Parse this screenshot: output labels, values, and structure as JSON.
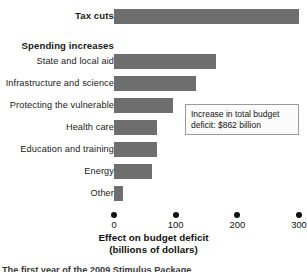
{
  "chart_data": {
    "type": "bar",
    "orientation": "horizontal",
    "title": "",
    "xlabel": "Effect on budget deficit",
    "xlabel_line2": "(billions of dollars)",
    "ylabel": "",
    "xlim": [
      0,
      300
    ],
    "xticks": [
      0,
      100,
      200,
      300
    ],
    "xtick_labels": [
      "0",
      "100",
      "200",
      "300"
    ],
    "grid": false,
    "legend": false,
    "bar_color": "#6e6e6e",
    "categories": [
      "Tax cuts",
      "Spending increases",
      "State and local aid",
      "Infrastructure and science",
      "Protecting the vulnerable",
      "Health care",
      "Education and training",
      "Energy",
      "Other"
    ],
    "values": [
      300,
      null,
      165,
      133,
      95,
      70,
      70,
      62,
      15
    ],
    "annotations": [
      "Increase in total budget deficit: $862 billion"
    ]
  },
  "rows": [
    {
      "label": "Tax cuts",
      "bold": true,
      "value": 300,
      "has_bar": true,
      "top": 6
    },
    {
      "label": "Spending increases",
      "bold": true,
      "value": null,
      "has_bar": false,
      "top": 36
    },
    {
      "label": "State and local aid",
      "bold": false,
      "value": 165,
      "has_bar": true,
      "top": 51
    },
    {
      "label": "Infrastructure and science",
      "bold": false,
      "value": 133,
      "has_bar": true,
      "top": 73
    },
    {
      "label": "Protecting the vulnerable",
      "bold": false,
      "value": 95,
      "has_bar": true,
      "top": 95
    },
    {
      "label": "Health care",
      "bold": false,
      "value": 70,
      "has_bar": true,
      "top": 117
    },
    {
      "label": "Education and training",
      "bold": false,
      "value": 70,
      "has_bar": true,
      "top": 139
    },
    {
      "label": "Energy",
      "bold": false,
      "value": 62,
      "has_bar": true,
      "top": 161
    },
    {
      "label": "Other",
      "bold": false,
      "value": 15,
      "has_bar": true,
      "top": 183
    }
  ],
  "axis": {
    "ticks": [
      {
        "label": "0",
        "value": 0
      },
      {
        "label": "100",
        "value": 100
      },
      {
        "label": "200",
        "value": 200
      },
      {
        "label": "300",
        "value": 300
      }
    ],
    "title_line1": "Effect on budget deficit",
    "title_line2": "(billions of dollars)"
  },
  "annotation": {
    "line1": "Increase in total budget",
    "line2": "deficit: $862 billion"
  },
  "caption": {
    "text": "The first year of the 2009 Stimulus Package"
  },
  "colors": {
    "bar": "#6e6e6e",
    "text": "#111111",
    "annotation_border": "#9a9a9a",
    "background": "#ffffff"
  }
}
